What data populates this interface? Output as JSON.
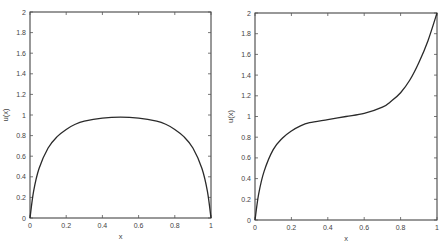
{
  "chart_data": [
    {
      "type": "line",
      "title": "",
      "xlabel": "x",
      "ylabel": "u(x)",
      "xlim": [
        0,
        1
      ],
      "ylim": [
        0,
        2
      ],
      "xticks": [
        "0",
        "0.2",
        "0.4",
        "0.6",
        "0.8",
        "1"
      ],
      "yticks": [
        "0",
        "0.2",
        "0.4",
        "0.6",
        "0.8",
        "1",
        "1.2",
        "1.4",
        "1.6",
        "1.8",
        "2"
      ],
      "grid": false,
      "legend": null,
      "series": [
        {
          "name": "u(x)",
          "x": [
            0,
            0.02,
            0.05,
            0.1,
            0.15,
            0.2,
            0.25,
            0.3,
            0.4,
            0.5,
            0.6,
            0.7,
            0.75,
            0.8,
            0.85,
            0.9,
            0.95,
            0.98,
            1
          ],
          "y": [
            0,
            0.26,
            0.48,
            0.68,
            0.79,
            0.86,
            0.91,
            0.94,
            0.97,
            0.98,
            0.97,
            0.94,
            0.91,
            0.86,
            0.79,
            0.68,
            0.48,
            0.26,
            0
          ]
        }
      ]
    },
    {
      "type": "line",
      "title": "",
      "xlabel": "x",
      "ylabel": "u(x)",
      "xlim": [
        0,
        1
      ],
      "ylim": [
        0,
        2
      ],
      "xticks": [
        "0",
        "0.2",
        "0.4",
        "0.6",
        "0.8",
        "1"
      ],
      "yticks": [
        "0",
        "0.2",
        "0.4",
        "0.6",
        "0.8",
        "1",
        "1.2",
        "1.4",
        "1.6",
        "1.8",
        "2"
      ],
      "grid": false,
      "legend": null,
      "series": [
        {
          "name": "u(x)",
          "x": [
            0,
            0.02,
            0.05,
            0.1,
            0.15,
            0.2,
            0.25,
            0.3,
            0.4,
            0.5,
            0.6,
            0.7,
            0.75,
            0.8,
            0.85,
            0.9,
            0.95,
            1
          ],
          "y": [
            0,
            0.25,
            0.47,
            0.68,
            0.79,
            0.86,
            0.91,
            0.94,
            0.97,
            1.0,
            1.03,
            1.09,
            1.15,
            1.23,
            1.35,
            1.52,
            1.73,
            2.0
          ]
        }
      ]
    }
  ]
}
